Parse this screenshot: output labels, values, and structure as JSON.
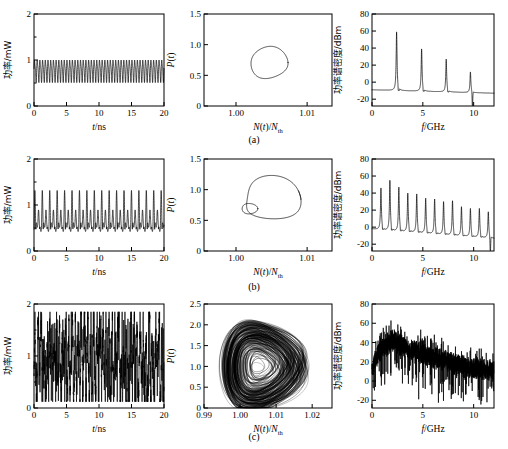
{
  "figure": {
    "captions": [
      {
        "label": "(a)"
      },
      {
        "label": "(b)"
      },
      {
        "label": "(c)"
      }
    ]
  },
  "axes_text": {
    "time_y_label": "功率/mW",
    "time_x_label": "t/ns",
    "phase_y_label": "P(t)",
    "phase_x_label": "N(t)/N",
    "phase_x_label_sub": "th",
    "spectrum_y_label": "功率谱密度/dBm",
    "spectrum_x_label": "f/GHz"
  },
  "chart_data": [
    {
      "id": "a-time",
      "type": "line",
      "title": "",
      "xlabel": "t/ns",
      "ylabel": "功率/mW",
      "xlim": [
        0,
        20
      ],
      "ylim": [
        0,
        2
      ],
      "xticks": [
        0,
        5,
        10,
        15,
        20
      ],
      "xticklabels": [
        "0",
        "5",
        "10",
        "15",
        "20"
      ],
      "yticks": [
        0,
        1,
        2
      ],
      "yticklabels": [
        "0",
        "1",
        "2"
      ],
      "yminor": [
        0.5,
        1.5
      ],
      "grid": false,
      "waveform": {
        "kind": "periodic",
        "frequency_ghz": 2.4,
        "mean": 0.78,
        "amplitude": 0.22,
        "description": "period-1 sustained relaxation oscillation, uniform amplitude"
      }
    },
    {
      "id": "a-phase",
      "type": "line",
      "title": "",
      "xlabel": "N(t)/Nth",
      "ylabel": "P(t)",
      "xlim": [
        0.9955,
        1.0135
      ],
      "ylim": [
        0,
        1.5
      ],
      "xticks": [
        1.0,
        1.01
      ],
      "xticklabels": [
        "1.00",
        "1.01"
      ],
      "yticks": [
        0,
        0.5,
        1.0,
        1.5
      ],
      "yticklabels": [
        "0",
        "0.5",
        "1.0",
        "1.5"
      ],
      "grid": false,
      "orbit": {
        "kind": "limit-cycle-period1",
        "center_x": 1.0045,
        "center_y": 0.71,
        "radius_x": 0.0026,
        "radius_y": 0.26,
        "description": "single closed loop (period-1 limit cycle)"
      }
    },
    {
      "id": "a-spectrum",
      "type": "line",
      "title": "",
      "xlabel": "f/GHz",
      "ylabel": "功率谱密度/dBm",
      "xlim": [
        0,
        12
      ],
      "ylim": [
        -28,
        80
      ],
      "xticks": [
        0,
        5,
        10
      ],
      "xticklabels": [
        "0",
        "5",
        "10"
      ],
      "yticks": [
        -20,
        0,
        20,
        40,
        60,
        80
      ],
      "yticklabels": [
        "-20",
        "0",
        "20",
        "40",
        "60",
        "80"
      ],
      "grid": false,
      "peaks": [
        {
          "f": 2.42,
          "amp": 59
        },
        {
          "f": 4.88,
          "amp": 39
        },
        {
          "f": 7.3,
          "amp": 27
        },
        {
          "f": 9.68,
          "amp": 12
        }
      ],
      "baseline_start": -9,
      "baseline_end": -13,
      "description": "period-1 spectrum: fundamental at 2.4 GHz plus harmonics, each followed by a sharp anti-resonance dip"
    },
    {
      "id": "b-time",
      "type": "line",
      "xlabel": "t/ns",
      "ylabel": "功率/mW",
      "xlim": [
        0,
        20
      ],
      "ylim": [
        0,
        2
      ],
      "xticks": [
        0,
        5,
        10,
        15,
        20
      ],
      "xticklabels": [
        "0",
        "5",
        "10",
        "15",
        "20"
      ],
      "yticks": [
        0,
        1,
        2
      ],
      "yticklabels": [
        "0",
        "1",
        "2"
      ],
      "yminor": [
        0.5,
        1.5
      ],
      "grid": false,
      "waveform": {
        "kind": "period-doubled",
        "frequency_ghz": 1.75,
        "mean": 0.72,
        "amplitude_large": 0.42,
        "amplitude_small": 0.16,
        "description": "period-2: alternating tall and short pulses"
      }
    },
    {
      "id": "b-phase",
      "type": "line",
      "xlabel": "N(t)/Nth",
      "ylabel": "P(t)",
      "xlim": [
        0.9955,
        1.0135
      ],
      "ylim": [
        0,
        1.5
      ],
      "xticks": [
        1.0,
        1.01
      ],
      "xticklabels": [
        "1.00",
        "1.01"
      ],
      "yticks": [
        0,
        0.5,
        1.0,
        1.5
      ],
      "yticklabels": [
        "0",
        "0.5",
        "1.0",
        "1.5"
      ],
      "grid": false,
      "orbit": {
        "kind": "limit-cycle-period2",
        "outer_center_x": 1.0045,
        "outer_center_y": 0.84,
        "outer_radius_x": 0.0042,
        "outer_radius_y": 0.35,
        "inner_center_x": 1.0018,
        "inner_center_y": 0.69,
        "inner_radius_x": 0.0011,
        "inner_radius_y": 0.085,
        "description": "large outer loop with small inner loop (period-2 orbit)"
      }
    },
    {
      "id": "b-spectrum",
      "type": "line",
      "xlabel": "f/GHz",
      "ylabel": "功率谱密度/dBm",
      "xlim": [
        0,
        12
      ],
      "ylim": [
        -28,
        80
      ],
      "xticks": [
        0,
        5,
        10
      ],
      "xticklabels": [
        "0",
        "5",
        "10"
      ],
      "yticks": [
        -20,
        0,
        20,
        40,
        60,
        80
      ],
      "yticklabels": [
        "-20",
        "0",
        "20",
        "40",
        "60",
        "80"
      ],
      "grid": false,
      "peaks": [
        {
          "f": 0.88,
          "amp": 46
        },
        {
          "f": 1.76,
          "amp": 55
        },
        {
          "f": 2.64,
          "amp": 47
        },
        {
          "f": 3.52,
          "amp": 40
        },
        {
          "f": 4.4,
          "amp": 39
        },
        {
          "f": 5.28,
          "amp": 34
        },
        {
          "f": 6.16,
          "amp": 33
        },
        {
          "f": 7.04,
          "amp": 30
        },
        {
          "f": 7.92,
          "amp": 31
        },
        {
          "f": 8.8,
          "amp": 24
        },
        {
          "f": 9.68,
          "amp": 22
        },
        {
          "f": 10.56,
          "amp": 22
        },
        {
          "f": 11.44,
          "amp": 18
        }
      ],
      "baseline_start": -2,
      "baseline_end": -13,
      "description": "period-2 spectrum: dense comb of peaks spaced ~0.88 GHz, decaying with frequency"
    },
    {
      "id": "c-time",
      "type": "line",
      "xlabel": "t/ns",
      "ylabel": "功率/mW",
      "xlim": [
        0,
        20
      ],
      "ylim": [
        0,
        2
      ],
      "xticks": [
        0,
        5,
        10,
        15,
        20
      ],
      "xticklabels": [
        "0",
        "5",
        "10",
        "15",
        "20"
      ],
      "yticks": [
        0,
        1,
        2
      ],
      "yticklabels": [
        "0",
        "1",
        "2"
      ],
      "yminor": [
        0.5,
        1.5
      ],
      "grid": false,
      "waveform": {
        "kind": "chaotic",
        "mean": 0.85,
        "peak_max": 1.85,
        "peak_min": 0.12,
        "description": "irregular chaotic pulsing with strongly varying amplitudes"
      }
    },
    {
      "id": "c-phase",
      "type": "scatter",
      "xlabel": "N(t)/Nth",
      "ylabel": "P(t)",
      "xlim": [
        0.99,
        1.0255
      ],
      "ylim": [
        0,
        2.5
      ],
      "xticks": [
        0.99,
        1.0,
        1.01,
        1.02
      ],
      "xticklabels": [
        "0.99",
        "1.00",
        "1.01",
        "1.02"
      ],
      "yticks": [
        0,
        0.5,
        1.0,
        1.5,
        2.0,
        2.5
      ],
      "yticklabels": [
        "0",
        "0.5",
        "1.0",
        "1.5",
        "2.0",
        "2.5"
      ],
      "grid": false,
      "attractor": {
        "kind": "chaotic-attractor",
        "center_x": 1.0065,
        "center_y": 1.0,
        "extent_x": [
          0.9935,
          1.0225
        ],
        "extent_y": [
          0.02,
          2.3
        ],
        "description": "dense filled chaotic attractor, teardrop shaped, many overlapping trajectories"
      }
    },
    {
      "id": "c-spectrum",
      "type": "line",
      "xlabel": "f/GHz",
      "ylabel": "功率谱密度/dBm",
      "xlim": [
        0,
        12
      ],
      "ylim": [
        -28,
        80
      ],
      "xticks": [
        0,
        5,
        10
      ],
      "xticklabels": [
        "0",
        "5",
        "10"
      ],
      "yticks": [
        -20,
        0,
        20,
        40,
        60,
        80
      ],
      "yticklabels": [
        "-20",
        "0",
        "20",
        "40",
        "60",
        "80"
      ],
      "grid": false,
      "noise_envelope": [
        {
          "f": 0,
          "amp": 18
        },
        {
          "f": 1,
          "amp": 34
        },
        {
          "f": 2,
          "amp": 42
        },
        {
          "f": 3,
          "amp": 36
        },
        {
          "f": 4,
          "amp": 31
        },
        {
          "f": 5,
          "amp": 28
        },
        {
          "f": 6,
          "amp": 24
        },
        {
          "f": 7,
          "amp": 22
        },
        {
          "f": 8,
          "amp": 18
        },
        {
          "f": 9,
          "amp": 15
        },
        {
          "f": 10,
          "amp": 13
        },
        {
          "f": 11,
          "amp": 12
        },
        {
          "f": 12,
          "amp": 11
        }
      ],
      "description": "broadband chaotic spectrum, noise-like, peaking near 2 GHz and rolling off"
    }
  ]
}
